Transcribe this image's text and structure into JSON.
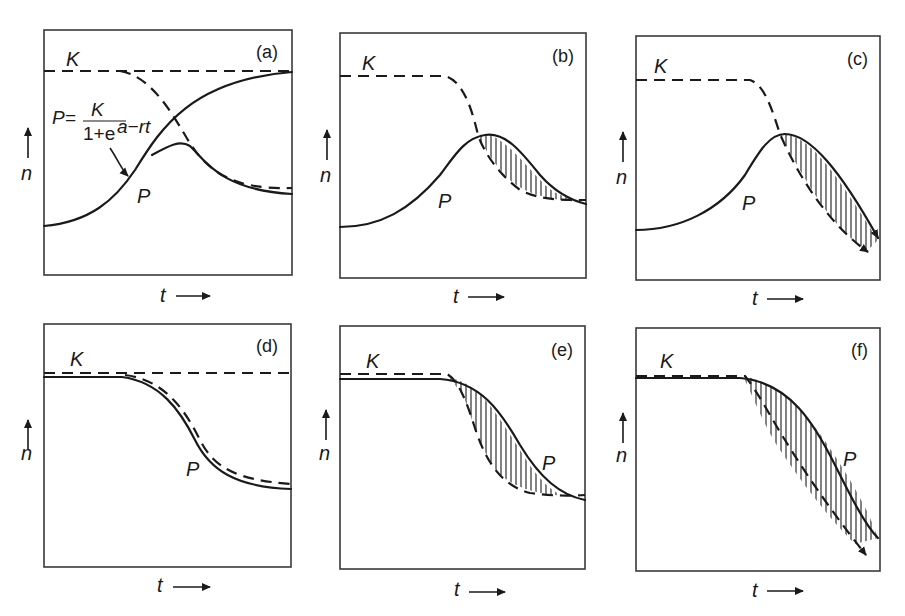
{
  "figure": {
    "panels": [
      {
        "id": "a",
        "tag": "(a)",
        "k_label": "K",
        "p_label": "P",
        "x_label": "t",
        "y_label": "n"
      },
      {
        "id": "b",
        "tag": "(b)",
        "k_label": "K",
        "p_label": "P",
        "x_label": "t",
        "y_label": "n"
      },
      {
        "id": "c",
        "tag": "(c)",
        "k_label": "K",
        "p_label": "P",
        "x_label": "t",
        "y_label": "n"
      },
      {
        "id": "d",
        "tag": "(d)",
        "k_label": "K",
        "p_label": "P",
        "x_label": "t",
        "y_label": "n"
      },
      {
        "id": "e",
        "tag": "(e)",
        "k_label": "K",
        "p_label": "P",
        "x_label": "t",
        "y_label": "n"
      },
      {
        "id": "f",
        "tag": "(f)",
        "k_label": "K",
        "p_label": "P",
        "x_label": "t",
        "y_label": "n"
      }
    ],
    "equation": {
      "lhs": "P=",
      "numerator": "K",
      "denominator": "1+e",
      "exponent": "a−rt"
    },
    "colors": {
      "ink": "#1a1a1a",
      "frame": "#3a3a3a",
      "background": "#ffffff"
    }
  }
}
